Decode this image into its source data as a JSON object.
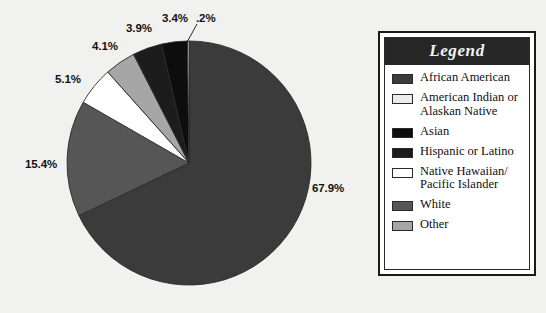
{
  "background_color": "#f1f1f0",
  "legend": {
    "title": "Legend",
    "title_bg": "#262626",
    "title_color": "#f2f2f2",
    "border_color": "#1a1a1a",
    "items": [
      {
        "label": "African American",
        "color": "#3b3b3b"
      },
      {
        "label": "American Indian or\nAlaskan Native",
        "color": "#ececed"
      },
      {
        "label": "Asian",
        "color": "#0d0d0d"
      },
      {
        "label": "Hispanic or Latino",
        "color": "#1c1c1c"
      },
      {
        "label": "Native Hawaiian/\nPacific Islander",
        "color": "#ffffff"
      },
      {
        "label": "White",
        "color": "#565656"
      },
      {
        "label": "Other",
        "color": "#a6a6a6"
      }
    ]
  },
  "chart_data": {
    "type": "pie",
    "title": "",
    "legend_position": "right",
    "center": {
      "x": 189,
      "y": 163
    },
    "radius": 122,
    "start_angle_deg": -90,
    "direction": "clockwise",
    "categories": [
      "African American",
      "White",
      "Native Hawaiian/Pacific Islander",
      "Other",
      "Hispanic or Latino",
      "Asian",
      "American Indian or Alaskan Native"
    ],
    "values": [
      67.9,
      15.4,
      5.1,
      4.1,
      3.9,
      3.4,
      0.2
    ],
    "slices": [
      {
        "name": "African American",
        "value": 67.9,
        "label": "67.9%",
        "color": "#3b3b3b",
        "label_x": 312,
        "label_y": 182
      },
      {
        "name": "White",
        "value": 15.4,
        "label": "15.4%",
        "color": "#565656",
        "label_x": 25,
        "label_y": 158
      },
      {
        "name": "Native Hawaiian/Pacific Islander",
        "value": 5.1,
        "label": "5.1%",
        "color": "#ffffff",
        "label_x": 55,
        "label_y": 73
      },
      {
        "name": "Other",
        "value": 4.1,
        "label": "4.1%",
        "color": "#a6a6a6",
        "label_x": 92,
        "label_y": 40
      },
      {
        "name": "Hispanic or Latino",
        "value": 3.9,
        "label": "3.9%",
        "color": "#1c1c1c",
        "label_x": 126,
        "label_y": 22
      },
      {
        "name": "Asian",
        "value": 3.4,
        "label": "3.4%",
        "color": "#0d0d0d",
        "label_x": 162,
        "label_y": 12
      },
      {
        "name": "American Indian or Alaskan Native",
        "value": 0.2,
        "label": ".2%",
        "color": "#ececed",
        "label_x": 196,
        "label_y": 12
      }
    ],
    "units": "percent",
    "total": 100.0
  }
}
